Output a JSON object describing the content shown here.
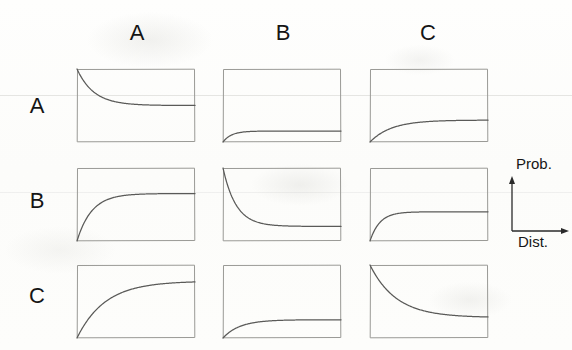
{
  "figure": {
    "background_color": "#fdfdfc",
    "curve_color": "#5a5a58",
    "frame_color": "#9a9a96",
    "text_color": "#151515"
  },
  "column_headers": [
    {
      "label": "A",
      "x": 137,
      "y": 20
    },
    {
      "label": "B",
      "x": 283,
      "y": 20
    },
    {
      "label": "C",
      "x": 428,
      "y": 20
    }
  ],
  "row_headers": [
    {
      "label": "A",
      "x": 22,
      "y": 93
    },
    {
      "label": "B",
      "x": 22,
      "y": 188
    },
    {
      "label": "C",
      "x": 22,
      "y": 283
    }
  ],
  "axis_key": {
    "y_label": "Prob.",
    "x_label": "Dist.",
    "x": 498,
    "y": 155,
    "width": 74,
    "height": 95
  },
  "chart_data": {
    "type": "line",
    "title": "",
    "xlabel": "Dist.",
    "ylabel": "Prob.",
    "xlim": [
      0,
      1
    ],
    "ylim": [
      0,
      1
    ],
    "grid": false,
    "legend": "none",
    "layout": {
      "rows": 3,
      "cols": 3,
      "row_labels": [
        "A",
        "B",
        "C"
      ],
      "col_labels": [
        "A",
        "B",
        "C"
      ]
    },
    "panel_geometry": {
      "col_x": [
        76,
        222,
        369
      ],
      "row_y": [
        68,
        167,
        264
      ],
      "width": 120,
      "height": 75
    },
    "panels": [
      {
        "row": "A",
        "col": "A",
        "shape": "decay",
        "start": 1.0,
        "asymptote": 0.5,
        "rate": 7.0,
        "description": "Decays steeply from the top of the panel to a mid-level plateau."
      },
      {
        "row": "A",
        "col": "B",
        "shape": "rise",
        "start": 0.0,
        "asymptote": 0.15,
        "rate": 14.0,
        "description": "Rises very sharply from zero to a very low plateau."
      },
      {
        "row": "A",
        "col": "C",
        "shape": "rise",
        "start": 0.0,
        "asymptote": 0.3,
        "rate": 5.5,
        "description": "Rises gradually from zero to a low-mid plateau."
      },
      {
        "row": "B",
        "col": "A",
        "shape": "rise",
        "start": 0.0,
        "asymptote": 0.65,
        "rate": 8.0,
        "description": "Rises quickly from zero to a high-mid plateau."
      },
      {
        "row": "B",
        "col": "B",
        "shape": "decay",
        "start": 1.0,
        "asymptote": 0.2,
        "rate": 9.0,
        "description": "Decays steeply from the top of the panel to a low plateau."
      },
      {
        "row": "B",
        "col": "C",
        "shape": "rise",
        "start": 0.0,
        "asymptote": 0.4,
        "rate": 12.0,
        "description": "Rises sharply from zero to a mid-level plateau."
      },
      {
        "row": "C",
        "col": "A",
        "shape": "rise",
        "start": 0.0,
        "asymptote": 0.78,
        "rate": 4.2,
        "description": "Rises slowly and smoothly from zero to a high plateau."
      },
      {
        "row": "C",
        "col": "B",
        "shape": "rise",
        "start": 0.0,
        "asymptote": 0.25,
        "rate": 7.0,
        "description": "Rises from zero to a low plateau."
      },
      {
        "row": "C",
        "col": "C",
        "shape": "decay",
        "start": 1.0,
        "asymptote": 0.28,
        "rate": 4.5,
        "description": "Decays gradually from the top of the panel to a low-mid plateau."
      }
    ]
  }
}
